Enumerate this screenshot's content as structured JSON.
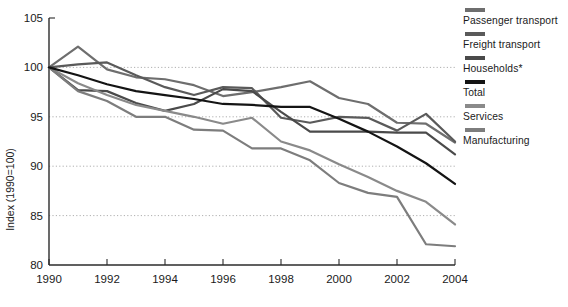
{
  "chart_data": {
    "type": "line",
    "title": "",
    "xlabel": "",
    "ylabel": "Index (1990=100)",
    "x": [
      1990,
      1991,
      1992,
      1993,
      1994,
      1995,
      1996,
      1997,
      1998,
      1999,
      2000,
      2001,
      2002,
      2003,
      2004
    ],
    "xlim": [
      1990,
      2004
    ],
    "ylim": [
      80,
      105
    ],
    "xticks": [
      "1990",
      "1992",
      "1994",
      "1996",
      "1998",
      "2000",
      "2002",
      "2004"
    ],
    "yticks": [
      "105",
      "100",
      "95",
      "90",
      "85",
      "80"
    ],
    "grid": "horizontal-dotted",
    "legend_position": "right",
    "series": [
      {
        "name": "Passenger transport",
        "color": "#6e6e6e",
        "values": [
          100.0,
          102.1,
          99.8,
          99.0,
          98.8,
          98.2,
          97.1,
          97.5,
          98.0,
          98.6,
          96.9,
          96.3,
          94.4,
          94.3,
          92.4
        ]
      },
      {
        "name": "Freight transport",
        "color": "#5a5a5a",
        "values": [
          100.0,
          100.3,
          100.5,
          99.2,
          98.0,
          97.2,
          98.0,
          97.9,
          94.9,
          94.4,
          95.0,
          94.9,
          93.6,
          95.3,
          92.5
        ]
      },
      {
        "name": "Households*",
        "color": "#4a4a4a",
        "values": [
          100.0,
          97.7,
          97.6,
          96.4,
          95.6,
          96.3,
          97.8,
          97.6,
          95.5,
          93.5,
          93.5,
          93.5,
          93.4,
          93.4,
          91.2
        ]
      },
      {
        "name": "Total",
        "color": "#141414",
        "values": [
          100.0,
          99.2,
          98.3,
          97.6,
          97.2,
          96.8,
          96.3,
          96.2,
          96.0,
          96.0,
          94.8,
          93.5,
          92.0,
          90.3,
          88.2
        ]
      },
      {
        "name": "Services",
        "color": "#8a8a8a",
        "values": [
          100.0,
          98.4,
          97.2,
          96.2,
          95.6,
          95.0,
          94.3,
          94.9,
          92.5,
          91.6,
          90.2,
          88.9,
          87.5,
          86.4,
          84.1
        ]
      },
      {
        "name": "Manufacturing",
        "color": "#7d7d7d",
        "values": [
          100.0,
          97.6,
          96.6,
          95.0,
          95.0,
          93.7,
          93.6,
          91.8,
          91.8,
          90.6,
          88.3,
          87.3,
          86.9,
          82.1,
          81.9
        ]
      }
    ]
  },
  "legend": {
    "items": [
      {
        "label": "Passenger transport"
      },
      {
        "label": "Freight transport"
      },
      {
        "label": "Households*"
      },
      {
        "label": "Total"
      },
      {
        "label": "Services"
      },
      {
        "label": "Manufacturing"
      }
    ]
  },
  "axes": {
    "y_title": "Index (1990=100)"
  }
}
